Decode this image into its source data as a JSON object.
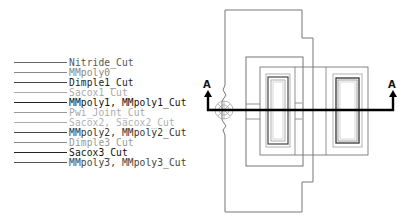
{
  "legend": {
    "items": [
      {
        "label": "Nitride_Cut",
        "color": "#555555",
        "line_color": "#666666",
        "line_width": 1
      },
      {
        "label": "MMpoly0",
        "color": "#888888",
        "line_color": "#888888",
        "line_width": 1
      },
      {
        "label": "Dimple1_Cut",
        "color": "#222222",
        "line_color": "#444444",
        "line_width": 1.2
      },
      {
        "label": "Sacox1_Cut",
        "color": "#aaaaaa",
        "line_color": "#aaaaaa",
        "line_width": 1
      },
      {
        "label": "MMpoly1, MMpoly1_Cut",
        "color": "#111111",
        "line_color": "#222222",
        "line_width": 1.5
      },
      {
        "label": "Pwi_Joint_Cut",
        "color": "#aaaaaa",
        "line_color": "#999999",
        "line_width": 1
      },
      {
        "label": "Sacox2, Sacox2_Cut",
        "color": "#b0b0b0",
        "line_color": "#aaaaaa",
        "line_width": 1
      },
      {
        "label": "MMpoly2, MMpoly2_Cut",
        "color": "#333333",
        "line_color": "#444444",
        "line_width": 1.2
      },
      {
        "label": "Dimple3_Cut",
        "color": "#999999",
        "line_color": "#888888",
        "line_width": 1
      },
      {
        "label": "Sacox3_Cut",
        "color": "#111111",
        "line_color": "#222222",
        "line_width": 1.3
      },
      {
        "label": "MMpoly3, MMpoly3_Cut",
        "color": "#444444",
        "line_color": "#555555",
        "line_width": 1
      }
    ]
  },
  "section_line": {
    "left_label": "A",
    "right_label": "A",
    "color": "#000000"
  }
}
